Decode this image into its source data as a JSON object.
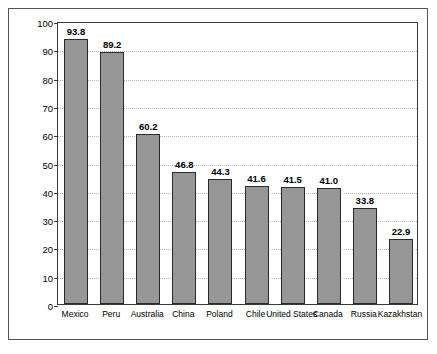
{
  "chart_data": {
    "type": "bar",
    "title": "",
    "xlabel": "",
    "ylabel": "Values in Millions of Ounces",
    "ylim": [
      0,
      100
    ],
    "ytick_values": [
      0,
      10,
      20,
      30,
      40,
      50,
      60,
      70,
      80,
      90,
      100
    ],
    "ytick_labels": [
      "0",
      "10",
      "20",
      "30",
      "40",
      "50",
      "60",
      "70",
      "80",
      "90",
      "100"
    ],
    "grid": "horizontal-dotted",
    "legend": "none",
    "bar_color": "#969696",
    "bar_edge_color": "#2a2a2a",
    "categories": [
      "Mexico",
      "Peru",
      "Australia",
      "China",
      "Poland",
      "Chile",
      "United States",
      "Canada",
      "Russia",
      "Kazakhstan"
    ],
    "values": [
      93.8,
      89.2,
      60.2,
      46.8,
      44.3,
      41.6,
      41.5,
      41.0,
      33.8,
      22.9
    ],
    "value_labels": [
      "93.8",
      "89.2",
      "60.2",
      "46.8",
      "44.3",
      "41.6",
      "41.5",
      "41.0",
      "33.8",
      "22.9"
    ]
  }
}
